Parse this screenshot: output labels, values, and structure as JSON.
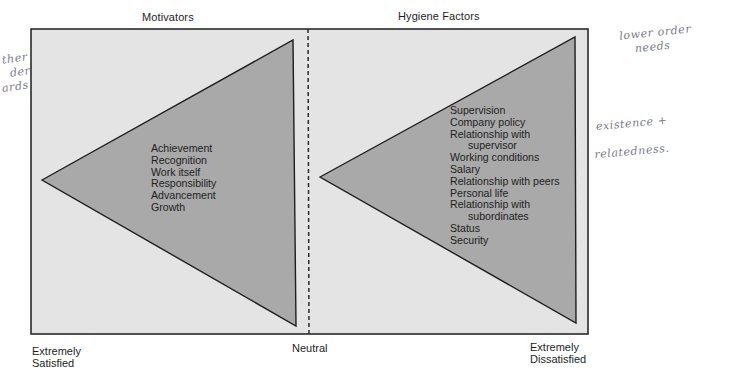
{
  "diagram": {
    "title_left": "Motivators",
    "title_right": "Hygiene Factors",
    "axis": {
      "left_end": [
        "Extremely",
        "Satisfied"
      ],
      "center": "Neutral",
      "right_end": [
        "Extremely",
        "Dissatisfied"
      ]
    },
    "motivators": {
      "items": [
        "Achievement",
        "Recognition",
        "Work itself",
        "Responsibility",
        "Advancement",
        "Growth"
      ]
    },
    "hygiene_factors": {
      "items": [
        {
          "text": "Supervision",
          "indent": false
        },
        {
          "text": "Company policy",
          "indent": false
        },
        {
          "text": "Relationship with",
          "indent": false
        },
        {
          "text": "supervisor",
          "indent": true
        },
        {
          "text": "Working conditions",
          "indent": false
        },
        {
          "text": "Salary",
          "indent": false
        },
        {
          "text": "Relationship with peers",
          "indent": false
        },
        {
          "text": "Personal life",
          "indent": false
        },
        {
          "text": "Relationship with",
          "indent": false
        },
        {
          "text": "subordinates",
          "indent": true
        },
        {
          "text": "Status",
          "indent": false
        },
        {
          "text": "Security",
          "indent": false
        }
      ]
    },
    "colors": {
      "box_fill": "#e4e4e4",
      "triangle_fill": "#a9a9a9",
      "stroke": "#1e1e1e"
    }
  },
  "annotations": {
    "left_margin": [
      "ther",
      "der",
      "ards"
    ],
    "right_top": [
      "lower order",
      "needs"
    ],
    "right_mid": [
      "existence +",
      "relatedness."
    ]
  }
}
